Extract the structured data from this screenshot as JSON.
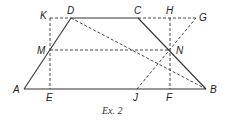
{
  "figure": {
    "caption": "Ex. 2",
    "colors": {
      "line": "#333333",
      "label": "#222222"
    }
  },
  "points": {
    "A": {
      "label": "A",
      "x": 24,
      "y": 89
    },
    "B": {
      "label": "B",
      "x": 206,
      "y": 89
    },
    "C": {
      "label": "C",
      "x": 138,
      "y": 18
    },
    "D": {
      "label": "D",
      "x": 71,
      "y": 18
    },
    "E": {
      "label": "E",
      "x": 50,
      "y": 89
    },
    "F": {
      "label": "F",
      "x": 170,
      "y": 89
    },
    "G": {
      "label": "G",
      "x": 196,
      "y": 18
    },
    "H": {
      "label": "H",
      "x": 170,
      "y": 18
    },
    "J": {
      "label": "J",
      "x": 137,
      "y": 89
    },
    "K": {
      "label": "K",
      "x": 50,
      "y": 18
    },
    "M": {
      "label": "M",
      "x": 50,
      "y": 50
    },
    "N": {
      "label": "N",
      "x": 170,
      "y": 50
    }
  },
  "segments": {
    "solid": [
      "A-B",
      "A-D",
      "D-C",
      "C-B"
    ],
    "dashed": [
      "K-D",
      "C-G",
      "K-E",
      "H-F",
      "M-N",
      "D-B",
      "J-G"
    ]
  }
}
